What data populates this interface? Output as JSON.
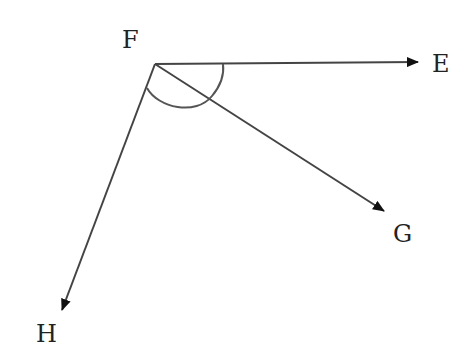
{
  "diagram": {
    "type": "angle-vectors",
    "vertex": {
      "name": "F",
      "x": 155,
      "y": 64,
      "label": "F",
      "label_x": 122,
      "label_y": 48
    },
    "rays": [
      {
        "id": "FE",
        "to": "E",
        "x2": 418,
        "y2": 62,
        "label": "E",
        "label_x": 432,
        "label_y": 72
      },
      {
        "id": "FG",
        "to": "G",
        "x2": 384,
        "y2": 211,
        "label": "G",
        "label_x": 393,
        "label_y": 242
      },
      {
        "id": "FH",
        "to": "H",
        "x2": 62,
        "y2": 310,
        "label": "H",
        "label_x": 36,
        "label_y": 342
      }
    ],
    "arc": {
      "description": "angle arc spanning from ray FH to ray FE",
      "path": "M 147 88 C 158 108, 196 116, 212 96 C 222 84, 224 72, 223 64"
    },
    "colors": {
      "line": "#444444",
      "arrow": "#111111",
      "label": "#222222"
    }
  }
}
